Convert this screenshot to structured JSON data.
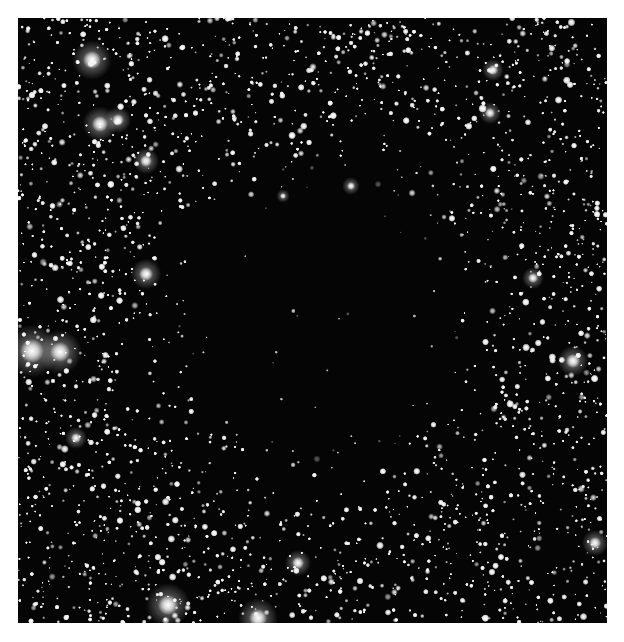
{
  "image": {
    "subject": "dark nebula against dense star field",
    "background_color": "#ffffff",
    "sky_color": "#050505",
    "cloud": {
      "cx": 300,
      "cy": 300,
      "rx": 190,
      "ry": 210
    },
    "bright_stars": [
      {
        "x": 74,
        "y": 42,
        "r": 9
      },
      {
        "x": 82,
        "y": 106,
        "r": 8
      },
      {
        "x": 100,
        "y": 102,
        "r": 6
      },
      {
        "x": 128,
        "y": 143,
        "r": 6
      },
      {
        "x": 128,
        "y": 256,
        "r": 7
      },
      {
        "x": 14,
        "y": 333,
        "r": 12
      },
      {
        "x": 42,
        "y": 334,
        "r": 10
      },
      {
        "x": 150,
        "y": 587,
        "r": 10
      },
      {
        "x": 280,
        "y": 545,
        "r": 6
      },
      {
        "x": 555,
        "y": 343,
        "r": 7
      },
      {
        "x": 577,
        "y": 525,
        "r": 6
      },
      {
        "x": 475,
        "y": 52,
        "r": 5
      },
      {
        "x": 472,
        "y": 95,
        "r": 5
      },
      {
        "x": 515,
        "y": 260,
        "r": 5
      },
      {
        "x": 333,
        "y": 168,
        "r": 4
      },
      {
        "x": 265,
        "y": 178,
        "r": 3
      },
      {
        "x": 58,
        "y": 420,
        "r": 5
      },
      {
        "x": 240,
        "y": 600,
        "r": 9
      }
    ]
  }
}
